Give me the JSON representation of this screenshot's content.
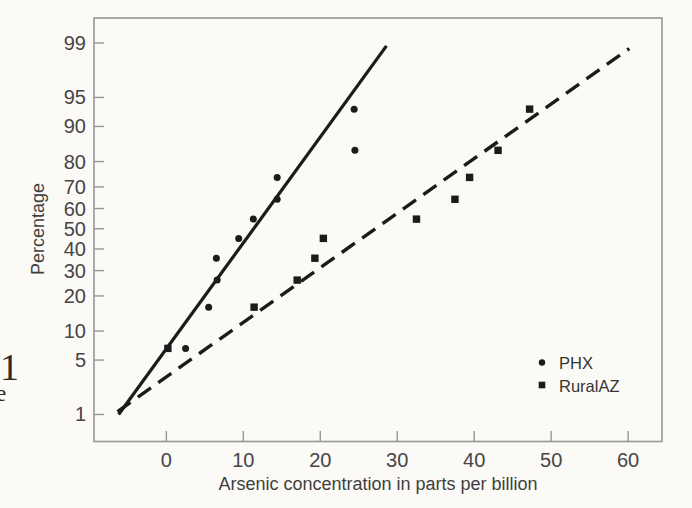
{
  "page": {
    "margin_text_fragments": [
      {
        "text": "1"
      },
      {
        "text": "e"
      }
    ]
  },
  "colors": {
    "background": "#fbfaf7",
    "frame": "#979797",
    "tick_text": "#454545",
    "data_ink": "#1b1b1b"
  },
  "chart_data": {
    "type": "scatter",
    "subtype": "normal-probability-plot",
    "title": "",
    "xlabel": "Arsenic concentration in parts per billion",
    "ylabel": "Percentage",
    "grid": false,
    "x_ticks": [
      0,
      10,
      20,
      30,
      40,
      50,
      60
    ],
    "y_ticks_percent": [
      1,
      5,
      10,
      20,
      30,
      40,
      50,
      60,
      70,
      80,
      90,
      95,
      99
    ],
    "xlim": [
      -9.4,
      64.4
    ],
    "ylim_percent": [
      0.4,
      99.6
    ],
    "legend_position": "lower-right",
    "series": [
      {
        "name": "PHX",
        "marker": "circle",
        "line_style": "solid",
        "points": [
          [
            2.5,
            6.7
          ],
          [
            5.5,
            16.3
          ],
          [
            6.6,
            26.0
          ],
          [
            6.5,
            35.6
          ],
          [
            9.4,
            45.2
          ],
          [
            11.3,
            54.8
          ],
          [
            14.4,
            64.4
          ],
          [
            14.4,
            74.0
          ],
          [
            24.5,
            83.7
          ],
          [
            24.4,
            93.3
          ]
        ],
        "fit_line": {
          "x1": -6.2,
          "p1": 1.0,
          "x2": 28.6,
          "p2": 98.9
        }
      },
      {
        "name": "RuralAZ",
        "marker": "square",
        "line_style": "dashed",
        "points": [
          [
            0.2,
            6.7
          ],
          [
            11.4,
            16.3
          ],
          [
            17.0,
            26.0
          ],
          [
            19.3,
            35.6
          ],
          [
            20.4,
            45.2
          ],
          [
            32.5,
            54.8
          ],
          [
            37.5,
            64.4
          ],
          [
            39.4,
            74.0
          ],
          [
            43.1,
            83.7
          ],
          [
            47.2,
            93.3
          ]
        ],
        "fit_line": {
          "x1": -6.35,
          "p1": 1.1,
          "x2": 60.15,
          "p2": 98.8
        }
      }
    ]
  }
}
